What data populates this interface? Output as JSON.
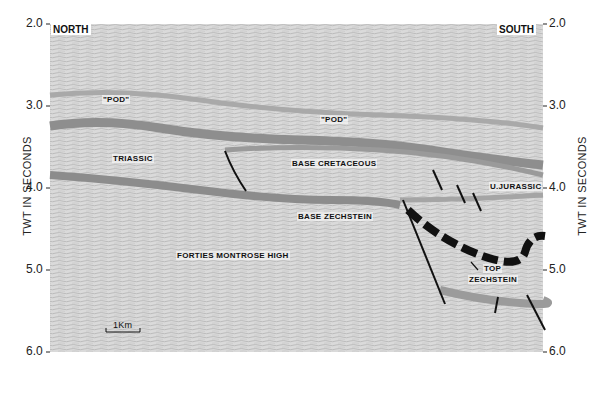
{
  "figure": {
    "type": "seismic_section",
    "direction_left": "NORTH",
    "direction_right": "SOUTH",
    "y_axis_label_left": "TWT IN SECONDS",
    "y_axis_label_right": "TWT IN SECONDS",
    "y_ticks": [
      "2.0",
      "3.0",
      "4.0",
      "5.0",
      "6.0"
    ],
    "y_range": [
      2.0,
      6.0
    ],
    "scale_bar": "1Km",
    "labels": {
      "pod_left": "\"POD\"",
      "pod_center": "\"POD\"",
      "triassic": "TRIASSIC",
      "base_cretaceous": "BASE CRETACEOUS",
      "u_jurassic": "U.JURASSIC",
      "base_zechstein": "BASE ZECHSTEIN",
      "forties_montrose_high": "FORTIES MONTROSE HIGH",
      "top_zechstein_1": "TOP",
      "top_zechstein_2": "ZECHSTEIN"
    },
    "colors": {
      "background": "#d8d8d8",
      "reflector": "#8a8a8a",
      "fault": "#111111"
    }
  }
}
